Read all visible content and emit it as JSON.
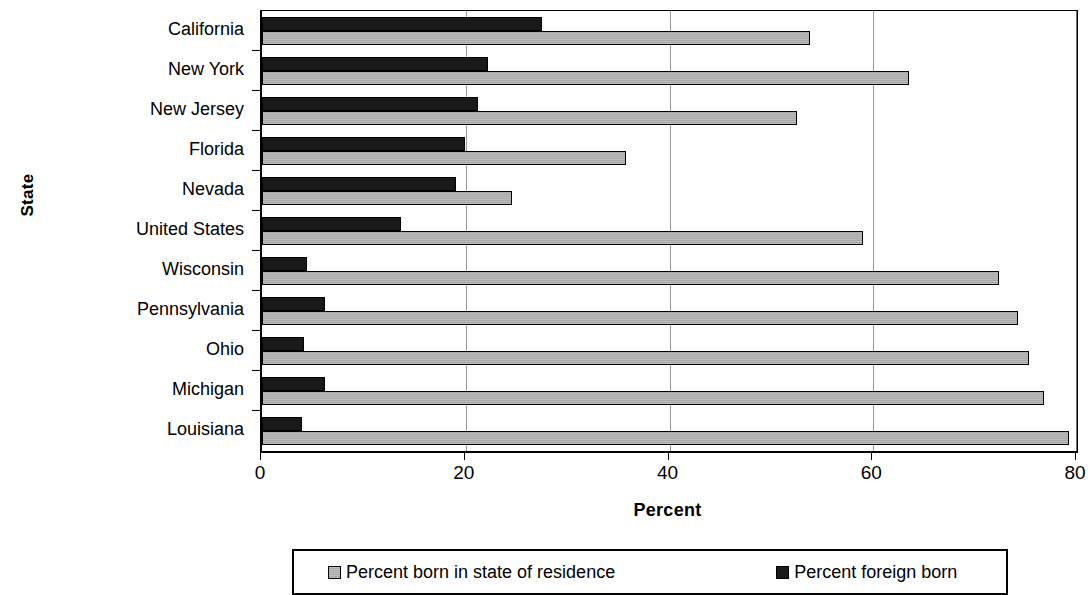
{
  "chart_data": {
    "type": "bar",
    "orientation": "horizontal",
    "title": "",
    "xlabel": "Percent",
    "ylabel": "State",
    "xlim": [
      0,
      80
    ],
    "xticks": [
      0,
      20,
      40,
      60,
      80
    ],
    "xtick_labels": [
      "0",
      "20",
      "40",
      "60",
      "80"
    ],
    "grid": "vertical",
    "legend_position": "bottom",
    "categories": [
      "California",
      "New York",
      "New Jersey",
      "Florida",
      "Nevada",
      "United States",
      "Wisconsin",
      "Pennsylvania",
      "Ohio",
      "Michigan",
      "Louisiana"
    ],
    "series": [
      {
        "name": "Percent born in state of residence",
        "color": "#a9a9a9",
        "values": [
          53.8,
          63.5,
          52.5,
          35.7,
          24.5,
          59.0,
          72.3,
          74.2,
          75.3,
          76.8,
          79.2
        ]
      },
      {
        "name": "Percent foreign born",
        "color": "#1a1a1a",
        "values": [
          27.5,
          22.2,
          21.2,
          19.9,
          19.0,
          13.6,
          4.4,
          6.2,
          4.1,
          6.2,
          3.9
        ]
      }
    ]
  },
  "legend": {
    "items": [
      {
        "label": "Percent born in state of residence",
        "swatch": "instate"
      },
      {
        "label": "Percent foreign born",
        "swatch": "foreign"
      }
    ]
  }
}
